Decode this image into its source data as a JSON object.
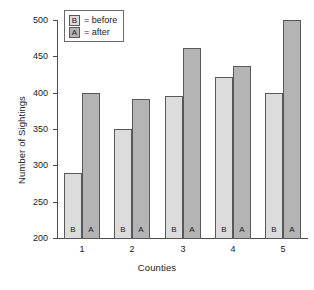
{
  "chart_data": {
    "type": "bar",
    "title": "",
    "xlabel": "Counties",
    "ylabel": "Number of Sightings",
    "categories": [
      "1",
      "2",
      "3",
      "4",
      "5"
    ],
    "ylim": [
      200,
      500
    ],
    "yticks": [
      200,
      250,
      300,
      350,
      400,
      450,
      500
    ],
    "grid": false,
    "legend_position": "top-left",
    "series": [
      {
        "name": "before",
        "key": "B",
        "color": "#dcdcdc",
        "values": [
          290,
          350,
          396,
          422,
          400
        ]
      },
      {
        "name": "after",
        "key": "A",
        "color": "#b4b4b4",
        "values": [
          400,
          391,
          461,
          437,
          500
        ]
      }
    ]
  },
  "legend": {
    "rows": [
      {
        "symbol": "B",
        "text": "= before"
      },
      {
        "symbol": "A",
        "text": "= after"
      }
    ]
  },
  "axes": {
    "y_title": "Number of Sightings",
    "x_title": "Counties",
    "y_tick_labels": [
      "500",
      "450",
      "400",
      "350",
      "300",
      "250",
      "200"
    ],
    "x_tick_labels": [
      "1",
      "2",
      "3",
      "4",
      "5"
    ]
  },
  "bar_tags": {
    "before": "B",
    "after": "A"
  }
}
